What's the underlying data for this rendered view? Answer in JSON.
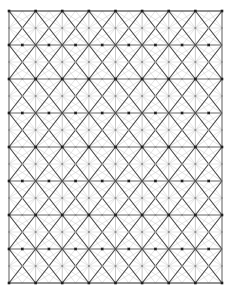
{
  "figure": {
    "type": "mesh-diagram",
    "background_color": "#ffffff",
    "canvas": {
      "width": 230,
      "height": 291
    }
  },
  "mesh": {
    "region": {
      "x": 9,
      "y": 11,
      "width": 213,
      "height": 272
    },
    "columns": 8,
    "rows": 8,
    "cell_width": 26.625,
    "cell_height": 34.0,
    "node_count": 81,
    "border_color": "#6a6a6a",
    "border_width": 0.9,
    "primary_line_color": "#4a4a4a",
    "primary_line_width": 1.15,
    "grid_line_color": "#9a9a9a",
    "grid_line_width": 0.55,
    "secondary_line_color": "#c9c9c9",
    "secondary_line_width": 0.5,
    "node_color": "#1e1e1e",
    "node_size": 2.6,
    "midpoint_dot_color": "#8c8c8c",
    "midpoint_dot_size": 1.0,
    "center_dot_color": "#b4b4b4",
    "center_dot_size": 0.85
  },
  "chart_data": {
    "type": "mesh",
    "x": {
      "min": 9,
      "max": 222,
      "divisions": 8,
      "step": 26.625
    },
    "y": {
      "min": 11,
      "max": 283,
      "divisions": 8,
      "step": 34.0
    },
    "grid": true,
    "legend": "none",
    "node_rows": 9,
    "node_columns": 9,
    "stagger": "alternate-rows-offset-half-cell"
  }
}
